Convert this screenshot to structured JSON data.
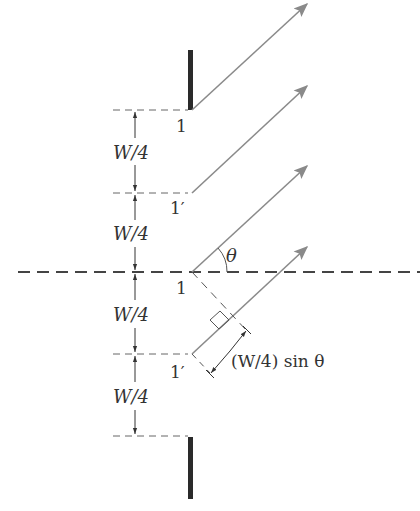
{
  "diagram": {
    "colors": {
      "slit_edge": "#2a2a2a",
      "ray": "#8a8a8a",
      "dashed": "#555555",
      "text": "#333333"
    },
    "labels": {
      "edge_top": "1",
      "edge_second": "1′",
      "edge_center": "1",
      "edge_fourth": "1′",
      "zone_1": "W/4",
      "zone_2": "W/4",
      "zone_3": "W/4",
      "zone_4": "W/4",
      "angle": "θ",
      "path_difference": "(W/4) sin θ"
    },
    "elements": {
      "slit_bars": [
        "top-slit-edge",
        "bottom-slit-edge"
      ],
      "rays": 4,
      "dashed_levels": 5,
      "optical_axis": "horizontal dashed line through slit center"
    }
  }
}
